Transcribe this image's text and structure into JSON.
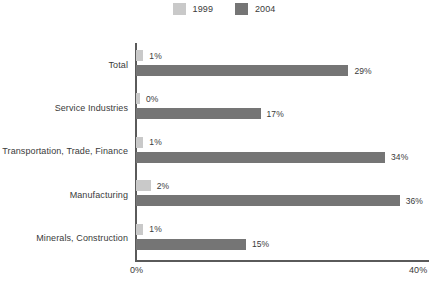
{
  "chart_data": {
    "type": "bar",
    "orientation": "horizontal",
    "title": "",
    "subtitle": "",
    "xlabel": "",
    "ylabel": "",
    "xlim": [
      0,
      40
    ],
    "xtick_labels": [
      "0%",
      "40%"
    ],
    "grid": false,
    "legend_position": "top-center",
    "categories": [
      "Total",
      "Service Industries",
      "Transportation, Trade, Finance",
      "Manufacturing",
      "Minerals, Construction"
    ],
    "series": [
      {
        "name": "1999",
        "color": "#c9c9c9",
        "values": [
          1,
          0,
          1,
          2,
          1
        ],
        "labels": [
          "1%",
          "0%",
          "1%",
          "2%",
          "1%"
        ]
      },
      {
        "name": "2004",
        "color": "#757575",
        "values": [
          29,
          17,
          34,
          36,
          15
        ],
        "labels": [
          "29%",
          "17%",
          "34%",
          "36%",
          "15%"
        ]
      }
    ]
  },
  "legend": {
    "items": [
      {
        "label": "1999",
        "color": "#c9c9c9"
      },
      {
        "label": "2004",
        "color": "#757575"
      }
    ]
  },
  "axis": {
    "min_label": "0%",
    "max_label": "40%"
  },
  "colors": {
    "series_1999": "#c9c9c9",
    "series_2004": "#757575",
    "axis": "#5a5a5a",
    "text": "#3a3a3a",
    "background": "#ffffff"
  }
}
